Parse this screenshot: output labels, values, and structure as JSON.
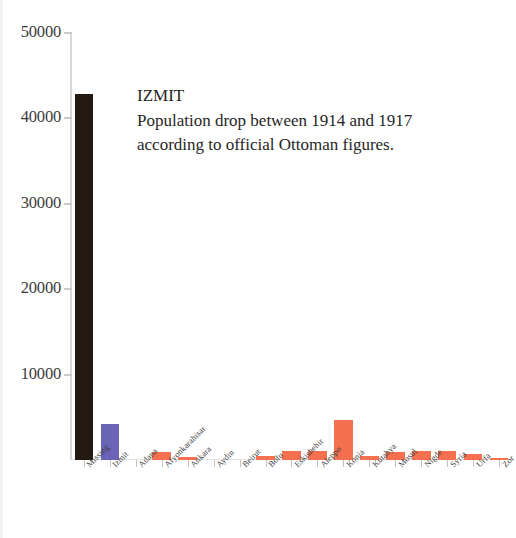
{
  "annotation": {
    "title": "IZMIT",
    "line1": "Population drop between 1914 and 1917",
    "line2": "according to official Ottoman figures."
  },
  "axis": {
    "y_ticks": [
      "10000",
      "20000",
      "30000",
      "40000",
      "50000"
    ],
    "axis_color": "#d7d7d7"
  },
  "colors": {
    "missing": "#231a14",
    "izmit": "#6b63b5",
    "other": "#f4704f"
  },
  "chart_data": {
    "type": "bar",
    "title": "",
    "subtitle": "",
    "xlabel": "",
    "ylabel": "",
    "ylim": [
      0,
      50000
    ],
    "yticks": [
      0,
      10000,
      20000,
      30000,
      40000,
      50000
    ],
    "grid": false,
    "legend": "none",
    "annotations": [
      "IZMIT",
      "Population drop between 1914 and 1917",
      "according to official Ottoman figures."
    ],
    "categories": [
      "Missing",
      "Izmit",
      "Adana",
      "Afyonkarahisar",
      "Ankara",
      "Aydin",
      "Beirut",
      "Bolu",
      "Eskishehir",
      "Aleppo",
      "Konia",
      "Kutahya",
      "Mosul",
      "Nigde",
      "Syria",
      "Urfa",
      "Zor"
    ],
    "values": [
      42900,
      4200,
      0,
      900,
      300,
      0,
      0,
      500,
      1100,
      1100,
      4700,
      500,
      900,
      1000,
      1000,
      700,
      200
    ],
    "bar_colors": [
      "#231a14",
      "#6b63b5",
      "#f4704f",
      "#f4704f",
      "#f4704f",
      "#f4704f",
      "#f4704f",
      "#f4704f",
      "#f4704f",
      "#f4704f",
      "#f4704f",
      "#f4704f",
      "#f4704f",
      "#f4704f",
      "#f4704f",
      "#f4704f",
      "#f4704f"
    ]
  }
}
